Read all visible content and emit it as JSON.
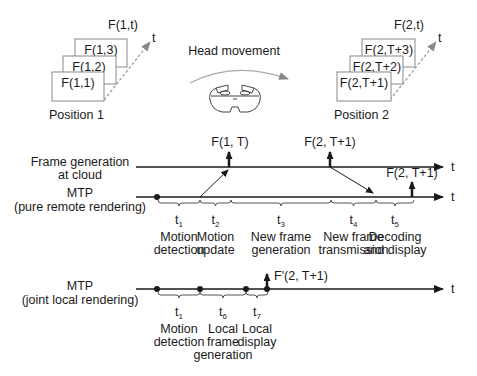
{
  "top": {
    "head_movement_label": "Head movement",
    "position1": {
      "label": "Position 1",
      "series_label": "F(1,t)",
      "axis_label": "t",
      "frames": [
        "F(1,1)",
        "F(1,2)",
        "F(1,3)"
      ]
    },
    "position2": {
      "label": "Position 2",
      "series_label": "F(2,t)",
      "axis_label": "t",
      "frames": [
        "F(2,T+1)",
        "F(2,T+2)",
        "F(2,T+3)"
      ]
    },
    "headset_icon": "vr-headset-icon"
  },
  "remote": {
    "cloud_label_line1": "Frame generation",
    "cloud_label_line2": "at cloud",
    "mtp_label_line1": "MTP",
    "mtp_label_line2": "(pure remote rendering)",
    "axis_label": "t",
    "events": {
      "cloud_first": "F(1, T)",
      "cloud_second": "F(2, T+1)",
      "display": "F(2, T+1)"
    },
    "segments": [
      {
        "symbol": "t",
        "sub": "1",
        "line1": "Motion",
        "line2": "detection"
      },
      {
        "symbol": "t",
        "sub": "2",
        "line1": "Motion",
        "line2": "update"
      },
      {
        "symbol": "t",
        "sub": "3",
        "line1": "New frame",
        "line2": "generation"
      },
      {
        "symbol": "t",
        "sub": "4",
        "line1": "New frame",
        "line2": "transmission"
      },
      {
        "symbol": "t",
        "sub": "5",
        "line1": "Decoding",
        "line2": "and display"
      }
    ]
  },
  "local": {
    "mtp_label_line1": "MTP",
    "mtp_label_line2": "(joint local rendering)",
    "axis_label": "t",
    "event": "F'(2, T+1)",
    "segments": [
      {
        "symbol": "t",
        "sub": "1",
        "line1": "Motion",
        "line2": "detection",
        "line3": ""
      },
      {
        "symbol": "t",
        "sub": "6",
        "line1": "Local",
        "line2": "frame",
        "line3": "generation"
      },
      {
        "symbol": "t",
        "sub": "7",
        "line1": "Local",
        "line2": "display",
        "line3": ""
      }
    ]
  }
}
